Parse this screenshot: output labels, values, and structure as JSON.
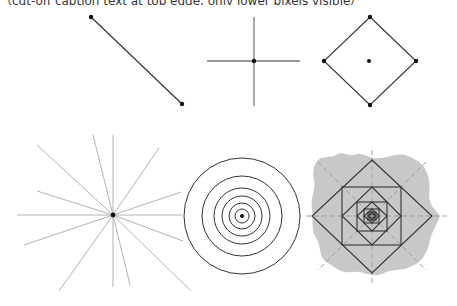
{
  "caption": {
    "text": "（cut-off caption text at top edge, only lower pixels visible）"
  },
  "figures": {
    "line_segment": {
      "label": "line-segment",
      "p1": [
        91,
        17
      ],
      "p2": [
        182,
        104
      ]
    },
    "cross": {
      "label": "cross",
      "center": [
        254,
        61
      ],
      "h": [
        207,
        300
      ],
      "v": [
        17,
        106
      ]
    },
    "diamond": {
      "label": "diamond-with-center",
      "top": [
        370,
        17
      ],
      "left": [
        324,
        61
      ],
      "right": [
        416,
        61
      ],
      "bottom": [
        370,
        105
      ],
      "center": [
        369,
        61
      ]
    },
    "starburst": {
      "label": "radiating-lines",
      "center": [
        113,
        215
      ],
      "endpoints": [
        [
          37,
          145
        ],
        [
          37,
          191
        ],
        [
          17,
          215
        ],
        [
          93,
          135
        ],
        [
          113,
          135
        ],
        [
          159,
          148
        ],
        [
          181,
          192
        ],
        [
          182,
          215
        ],
        [
          24,
          245
        ],
        [
          59,
          291
        ],
        [
          113,
          287
        ],
        [
          130,
          285
        ],
        [
          191,
          291
        ],
        [
          183,
          241
        ]
      ]
    },
    "concentric": {
      "label": "concentric-circles",
      "center": [
        242,
        216
      ],
      "radii": [
        58,
        40,
        28,
        20,
        13,
        7
      ]
    },
    "nested_squares": {
      "label": "nested-squares-on-blob",
      "center": [
        372,
        216
      ],
      "blob_color": "#c8c8c8",
      "stroke_color": "#333333",
      "dash_color": "#999999"
    }
  },
  "colors": {
    "stroke": "#333333",
    "light_stroke": "#aaaaaa",
    "point": "#111111"
  }
}
